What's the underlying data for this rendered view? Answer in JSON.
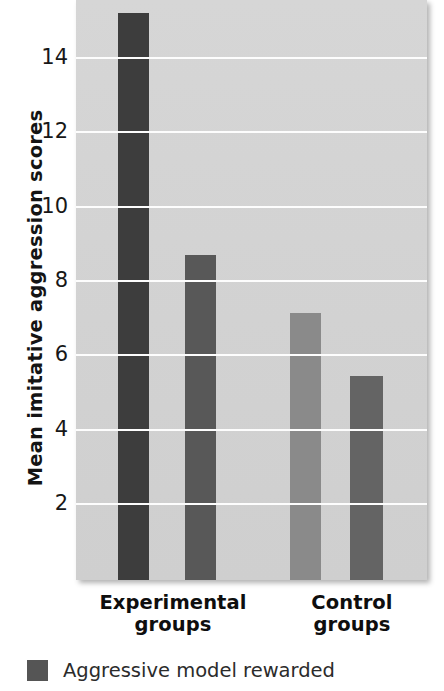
{
  "chart_data": {
    "type": "bar",
    "title": "",
    "subtitle": "",
    "xlabel": "",
    "ylabel": "Mean imitative aggression scores",
    "ylim": [
      0,
      15.6
    ],
    "yticks": [
      2,
      4,
      6,
      8,
      10,
      12,
      14
    ],
    "ytick_labels": [
      "2",
      "4",
      "6",
      "8",
      "10",
      "12",
      "14"
    ],
    "grid": true,
    "legend_position": "below-left",
    "categories": [
      "Experimental groups",
      "Control groups"
    ],
    "category_lines": [
      [
        "Experimental",
        "groups"
      ],
      [
        "Control",
        "groups"
      ]
    ],
    "bars": [
      {
        "group": "Experimental groups",
        "series": "Aggressive model rewarded",
        "value": 15.2,
        "color": "#3d3d3d"
      },
      {
        "group": "Experimental groups",
        "series": "bar-2",
        "value": 8.7,
        "color": "#585858"
      },
      {
        "group": "Control groups",
        "series": "bar-3",
        "value": 7.15,
        "color": "#8a8a8a"
      },
      {
        "group": "Control groups",
        "series": "bar-4",
        "value": 5.45,
        "color": "#646464"
      }
    ],
    "series": [
      {
        "name": "Aggressive model rewarded",
        "values": [
          15.2,
          7.15
        ],
        "color": "#3d3d3d"
      },
      {
        "name": "bar-2",
        "values": [
          8.7,
          5.45
        ],
        "color": "#585858"
      }
    ],
    "legend": [
      {
        "label": "Aggressive model rewarded",
        "color": "#555555"
      }
    ],
    "plot_background": "#d2d2d2",
    "gridline_color": "#fdfdfd"
  },
  "legend": {
    "item_label": "Aggressive model rewarded"
  },
  "axis": {
    "y_title": "Mean imitative aggression scores"
  }
}
